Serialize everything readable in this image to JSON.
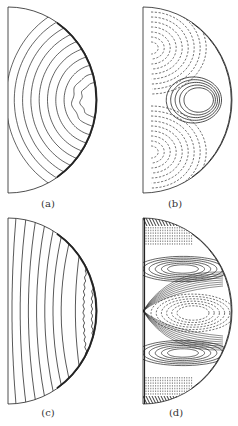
{
  "figure": {
    "panels": [
      {
        "id": "a",
        "label": "(a)",
        "x0": 8,
        "cy": 100,
        "rx": 89,
        "ry": 93,
        "label_x": 28,
        "label_y": 198,
        "kind": "concentric-solid"
      },
      {
        "id": "b",
        "label": "(b)",
        "x0": 143,
        "cy": 100,
        "rx": 89,
        "ry": 93,
        "label_x": 155,
        "label_y": 198,
        "kind": "cells-solid-dashed"
      },
      {
        "id": "c",
        "label": "(c)",
        "x0": 8,
        "cy": 311,
        "rx": 89,
        "ry": 93,
        "label_x": 28,
        "label_y": 407,
        "kind": "wavy-solid"
      },
      {
        "id": "d",
        "label": "(d)",
        "x0": 143,
        "cy": 311,
        "rx": 89,
        "ry": 93,
        "label_x": 156,
        "label_y": 407,
        "kind": "multi-cell"
      }
    ],
    "colors": {
      "line": "#222222",
      "dashed": "#333333",
      "background": "#ffffff"
    }
  }
}
